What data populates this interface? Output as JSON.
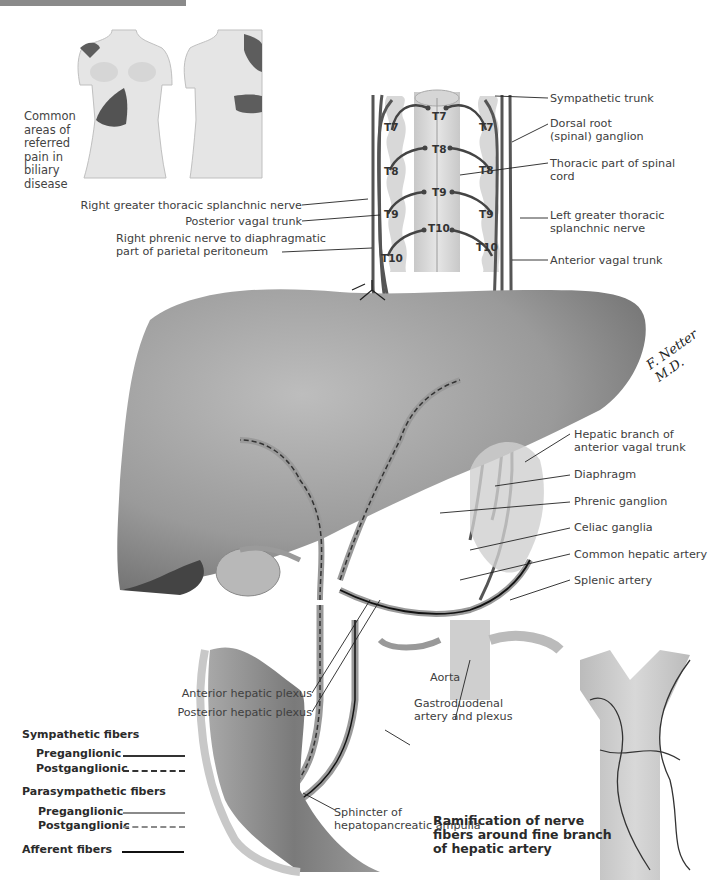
{
  "figure": {
    "referred_pain_caption": "Common\nareas of\nreferred\npain in\nbiliary\ndisease",
    "signature": "F. Netter M.D.",
    "spinal_segments": {
      "left_ganglia": [
        "T7",
        "T8",
        "T9",
        "T10"
      ],
      "cord": [
        "T7",
        "T8",
        "T9",
        "T10"
      ],
      "right_ganglia": [
        "T7",
        "T8",
        "T9",
        "T10"
      ]
    },
    "labels_left": [
      {
        "id": "right-greater-thoracic-splanchnic-nerve",
        "text": "Right greater thoracic splanchnic nerve"
      },
      {
        "id": "posterior-vagal-trunk",
        "text": "Posterior vagal trunk"
      },
      {
        "id": "right-phrenic-nerve",
        "text": "Right phrenic nerve to diaphragmatic\npart of parietal peritoneum"
      },
      {
        "id": "anterior-hepatic-plexus",
        "text": "Anterior hepatic plexus"
      },
      {
        "id": "posterior-hepatic-plexus",
        "text": "Posterior hepatic plexus"
      }
    ],
    "labels_right": [
      {
        "id": "sympathetic-trunk",
        "text": "Sympathetic trunk"
      },
      {
        "id": "dorsal-root-ganglion",
        "text": "Dorsal root\n(spinal) ganglion"
      },
      {
        "id": "thoracic-spinal-cord",
        "text": "Thoracic part of spinal\ncord"
      },
      {
        "id": "left-greater-thoracic-splanchnic-nerve",
        "text": "Left greater thoracic\nsplanchnic nerve"
      },
      {
        "id": "anterior-vagal-trunk",
        "text": "Anterior vagal trunk"
      },
      {
        "id": "hepatic-branch-anterior-vagal-trunk",
        "text": "Hepatic branch of\nanterior vagal trunk"
      },
      {
        "id": "diaphragm",
        "text": "Diaphragm"
      },
      {
        "id": "phrenic-ganglion",
        "text": "Phrenic ganglion"
      },
      {
        "id": "celiac-ganglia",
        "text": "Celiac ganglia"
      },
      {
        "id": "common-hepatic-artery",
        "text": "Common hepatic artery"
      },
      {
        "id": "splenic-artery",
        "text": "Splenic artery"
      }
    ],
    "labels_bottom": [
      {
        "id": "aorta",
        "text": "Aorta"
      },
      {
        "id": "gastroduodenal-artery",
        "text": "Gastroduodenal\nartery and plexus"
      },
      {
        "id": "sphincter",
        "text": "Sphincter of\nhepatopancreatic ampulla"
      }
    ],
    "inset_title": "Ramification of nerve\nfibers around fine branch\nof hepatic artery"
  },
  "legend": {
    "sympathetic": {
      "heading": "Sympathetic fibers",
      "pre": "Preganglionic",
      "post": "Postganglionic"
    },
    "parasympathetic": {
      "heading": "Parasympathetic fibers",
      "pre": "Preganglionic",
      "post": "Postganglionic"
    },
    "afferent": "Afferent fibers",
    "colors": {
      "sympathetic": "#333333",
      "parasympathetic": "#8a8a8a",
      "afferent": "#111111"
    }
  }
}
